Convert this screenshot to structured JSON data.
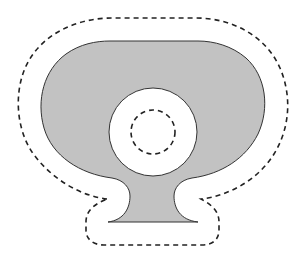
{
  "diagram": {
    "colors": {
      "fill": "#c2c2c2",
      "stroke": "#333333",
      "dash": "#222222",
      "background": "#ffffff"
    },
    "shapes": {
      "solid_region": "gray-shape",
      "hole": "white-circle",
      "outer_outline": "dashed-offset-outline",
      "inner_outline": "dashed-inner-circle"
    }
  }
}
